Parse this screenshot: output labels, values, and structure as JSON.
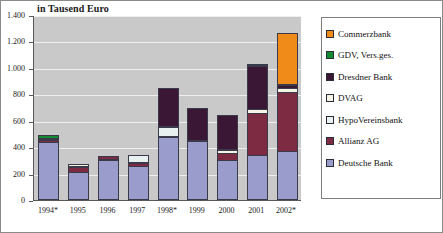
{
  "chart_data": {
    "type": "bar",
    "subtype": "stacked-column",
    "title": "in Tausend Euro",
    "xlabel": "",
    "ylabel": "",
    "ylim": [
      0,
      1400
    ],
    "ytick_values": [
      0,
      200,
      400,
      600,
      800,
      1000,
      1200,
      1400
    ],
    "ytick_labels": [
      "0",
      "200",
      "400",
      "600",
      "800",
      "1.000",
      "1.200",
      "1.400"
    ],
    "grid": true,
    "grid_axis": "y",
    "legend_position": "right",
    "categories": [
      "1994*",
      "1995",
      "1996",
      "1997",
      "1998*",
      "1999",
      "2000",
      "2001",
      "2002*"
    ],
    "series": [
      {
        "name": "Deutsche Bank",
        "color": "#9a9ccb",
        "values": [
          440,
          215,
          300,
          255,
          480,
          450,
          300,
          340,
          370
        ]
      },
      {
        "name": "Allianz AG",
        "color": "#7d2b43",
        "values": [
          20,
          40,
          35,
          30,
          15,
          0,
          60,
          325,
          455
        ]
      },
      {
        "name": "HypoVereinsbank",
        "color": "#e8f0f0",
        "values": [
          0,
          0,
          0,
          65,
          75,
          0,
          0,
          0,
          0
        ]
      },
      {
        "name": "DVAG",
        "color": "#f5f2e6",
        "values": [
          0,
          25,
          0,
          0,
          0,
          0,
          35,
          40,
          40
        ]
      },
      {
        "name": "Dresdner Bank",
        "color": "#3b1736",
        "values": [
          15,
          0,
          0,
          0,
          290,
          250,
          265,
          330,
          30
        ]
      },
      {
        "name": "GDV, Vers.ges.",
        "color": "#128a30",
        "values": [
          30,
          0,
          0,
          0,
          0,
          0,
          0,
          0,
          0
        ]
      },
      {
        "name": "Commerzbank",
        "color": "#f08a19",
        "values": [
          0,
          0,
          0,
          0,
          0,
          0,
          0,
          20,
          395
        ]
      }
    ],
    "totals": [
      505,
      280,
      335,
      350,
      860,
      700,
      660,
      1055,
      1290
    ]
  },
  "legend": {
    "items": [
      {
        "label": "Commerzbank",
        "color": "#f08a19"
      },
      {
        "label": "GDV, Vers.ges.",
        "color": "#128a30"
      },
      {
        "label": "Dresdner Bank",
        "color": "#3b1736"
      },
      {
        "label": "DVAG",
        "color": "#f5f2e6"
      },
      {
        "label": "HypoVereinsbank",
        "color": "#e8f0f0"
      },
      {
        "label": "Allianz AG",
        "color": "#7d2b43"
      },
      {
        "label": "Deutsche Bank",
        "color": "#9a9ccb"
      }
    ]
  },
  "style": {
    "plot_background": "#c9c9c9",
    "gridline_color": "#efefef",
    "axis_color": "#585858",
    "frame_color": "#8a8a8a"
  }
}
